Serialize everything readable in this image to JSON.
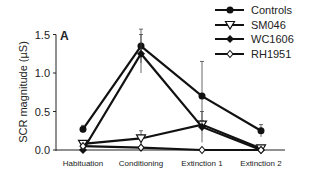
{
  "chart_data": {
    "type": "line",
    "panel_label": "A",
    "title": "",
    "xlabel": "",
    "ylabel": "SCR magnitude (µS)",
    "ylim": [
      0,
      1.5
    ],
    "yticks": [
      "0.0",
      "0.5",
      "1.0",
      "1.5"
    ],
    "categories": [
      "Habituation",
      "Conditioning",
      "Extinction 1",
      "Extinction 2"
    ],
    "grid": false,
    "legend_position": "top-right",
    "series": [
      {
        "name": "Controls",
        "marker": "filled-circle",
        "values": [
          0.27,
          1.35,
          0.7,
          0.25
        ],
        "err": [
          0.05,
          0.22,
          0.45,
          0.08
        ]
      },
      {
        "name": "SM046",
        "marker": "open-triangle-down",
        "values": [
          0.08,
          0.15,
          0.33,
          0.02
        ],
        "err": [
          0.03,
          0.1,
          0.05,
          0.02
        ]
      },
      {
        "name": "WC1606",
        "marker": "filled-diamond",
        "values": [
          0.0,
          1.25,
          0.3,
          0.0
        ],
        "err": [
          0.0,
          0.25,
          0.2,
          0.0
        ]
      },
      {
        "name": "RH1951",
        "marker": "open-diamond",
        "values": [
          0.05,
          0.03,
          0.0,
          0.0
        ],
        "err": [
          0.0,
          0.0,
          0.0,
          0.0
        ]
      }
    ]
  }
}
